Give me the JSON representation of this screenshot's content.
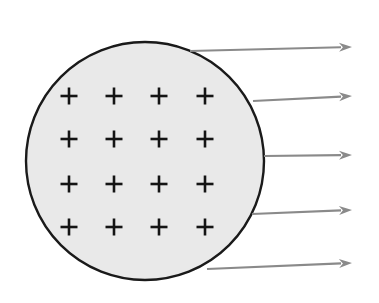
{
  "figure": {
    "background_color": "#ffffff",
    "width": 379,
    "height": 303
  },
  "sphere": {
    "label": "charged-sphere",
    "center_x": 145,
    "center_y": 161,
    "radius": 119,
    "fill_color": "#e9e9e9",
    "stroke_color": "#1a1a1a",
    "stroke_width": 2.4
  },
  "charges": {
    "symbol": "+",
    "sign": "positive",
    "count": 16,
    "rows": 4,
    "columns": 4,
    "color": "#141414",
    "arm_length": 8.5,
    "stroke_width": 2.6,
    "positions": [
      {
        "x": 69,
        "y": 96
      },
      {
        "x": 114,
        "y": 96
      },
      {
        "x": 159,
        "y": 96
      },
      {
        "x": 205,
        "y": 96
      },
      {
        "x": 69,
        "y": 139
      },
      {
        "x": 114,
        "y": 139
      },
      {
        "x": 159,
        "y": 139
      },
      {
        "x": 205,
        "y": 139
      },
      {
        "x": 69,
        "y": 184
      },
      {
        "x": 114,
        "y": 184
      },
      {
        "x": 159,
        "y": 184
      },
      {
        "x": 205,
        "y": 184
      },
      {
        "x": 69,
        "y": 227
      },
      {
        "x": 114,
        "y": 227
      },
      {
        "x": 159,
        "y": 227
      },
      {
        "x": 205,
        "y": 227
      }
    ]
  },
  "field_arrows": {
    "label": "electric-field-lines",
    "count": 5,
    "color": "#8a8a8a",
    "stroke_width": 2.2,
    "head_length": 13,
    "head_width": 9,
    "direction": "outward-right",
    "lines": [
      {
        "name": "field-arrow-1",
        "x1": 190,
        "y1": 51,
        "x2": 352,
        "y2": 47
      },
      {
        "name": "field-arrow-2",
        "x1": 253,
        "y1": 101,
        "x2": 352,
        "y2": 96
      },
      {
        "name": "field-arrow-3",
        "x1": 264,
        "y1": 156,
        "x2": 352,
        "y2": 155
      },
      {
        "name": "field-arrow-4",
        "x1": 252,
        "y1": 214,
        "x2": 352,
        "y2": 210
      },
      {
        "name": "field-arrow-5",
        "x1": 207,
        "y1": 269,
        "x2": 352,
        "y2": 263
      }
    ]
  }
}
